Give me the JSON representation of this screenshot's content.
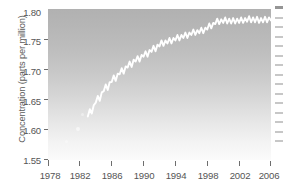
{
  "chart_data": {
    "type": "line",
    "title": "",
    "subtitle": "",
    "xlabel": "",
    "ylabel": "Concentration (parts per million)",
    "xlim": [
      1978,
      2006
    ],
    "ylim": [
      1.55,
      1.8
    ],
    "grid": false,
    "legend": null,
    "x_tick_labels": [
      "1978",
      "1982",
      "1986",
      "1990",
      "1994",
      "1998",
      "2002",
      "2006"
    ],
    "x_ticks": [
      1978,
      1982,
      1986,
      1990,
      1994,
      1998,
      2002,
      2006
    ],
    "y_tick_labels": [
      "1.55",
      "1.60",
      "1.65",
      "1.70",
      "1.75",
      "1.80"
    ],
    "y_ticks": [
      1.55,
      1.6,
      1.65,
      1.7,
      1.75,
      1.8
    ],
    "series": [
      {
        "name": "Concentration",
        "color": "#ffffff",
        "note": "White trace on grey gradient panel; annual seasonal sawtooth superimposed on rising trend that flattens after 1999",
        "x": [
          1983.0,
          1983.25,
          1983.5,
          1983.75,
          1984.0,
          1984.25,
          1984.5,
          1984.75,
          1985.0,
          1985.25,
          1985.5,
          1985.75,
          1986.0,
          1986.25,
          1986.5,
          1986.75,
          1987.0,
          1987.25,
          1987.5,
          1987.75,
          1988.0,
          1988.25,
          1988.5,
          1988.75,
          1989.0,
          1989.25,
          1989.5,
          1989.75,
          1990.0,
          1990.25,
          1990.5,
          1990.75,
          1991.0,
          1991.25,
          1991.5,
          1991.75,
          1992.0,
          1992.25,
          1992.5,
          1992.75,
          1993.0,
          1993.25,
          1993.5,
          1993.75,
          1994.0,
          1994.25,
          1994.5,
          1994.75,
          1995.0,
          1995.25,
          1995.5,
          1995.75,
          1996.0,
          1996.25,
          1996.5,
          1996.75,
          1997.0,
          1997.25,
          1997.5,
          1997.75,
          1998.0,
          1998.25,
          1998.5,
          1998.75,
          1999.0,
          1999.25,
          1999.5,
          1999.75,
          2000.0,
          2000.25,
          2000.5,
          2000.75,
          2001.0,
          2001.25,
          2001.5,
          2001.75,
          2002.0,
          2002.25,
          2002.5,
          2002.75,
          2003.0,
          2003.25,
          2003.5,
          2003.75,
          2004.0,
          2004.25,
          2004.5,
          2004.75,
          2005.0,
          2005.25,
          2005.5,
          2005.75,
          2006.0
        ],
        "y": [
          1.622,
          1.634,
          1.627,
          1.641,
          1.645,
          1.656,
          1.648,
          1.662,
          1.664,
          1.675,
          1.666,
          1.679,
          1.679,
          1.69,
          1.681,
          1.693,
          1.692,
          1.702,
          1.693,
          1.705,
          1.703,
          1.713,
          1.704,
          1.716,
          1.713,
          1.722,
          1.713,
          1.724,
          1.721,
          1.73,
          1.721,
          1.732,
          1.729,
          1.739,
          1.73,
          1.741,
          1.738,
          1.748,
          1.739,
          1.748,
          1.743,
          1.752,
          1.743,
          1.752,
          1.748,
          1.757,
          1.748,
          1.757,
          1.752,
          1.761,
          1.752,
          1.761,
          1.757,
          1.766,
          1.757,
          1.765,
          1.76,
          1.769,
          1.76,
          1.769,
          1.766,
          1.776,
          1.768,
          1.777,
          1.775,
          1.784,
          1.775,
          1.783,
          1.777,
          1.786,
          1.776,
          1.784,
          1.776,
          1.785,
          1.776,
          1.784,
          1.777,
          1.786,
          1.777,
          1.785,
          1.779,
          1.788,
          1.778,
          1.786,
          1.778,
          1.787,
          1.777,
          1.785,
          1.778,
          1.787,
          1.778,
          1.786,
          1.781
        ]
      }
    ]
  },
  "axes": {
    "ylabel": "Concentration (parts per million)",
    "y_ticks": [
      {
        "label": "1.80",
        "value": 1.8
      },
      {
        "label": "1.75",
        "value": 1.75
      },
      {
        "label": "1.70",
        "value": 1.7
      },
      {
        "label": "1.65",
        "value": 1.65
      },
      {
        "label": "1.60",
        "value": 1.6
      },
      {
        "label": "1.55",
        "value": 1.55
      }
    ],
    "x_ticks": [
      {
        "label": "1978",
        "value": 1978
      },
      {
        "label": "1982",
        "value": 1982
      },
      {
        "label": "1986",
        "value": 1986
      },
      {
        "label": "1990",
        "value": 1990
      },
      {
        "label": "1994",
        "value": 1994
      },
      {
        "label": "1998",
        "value": 1998
      },
      {
        "label": "2002",
        "value": 2002
      },
      {
        "label": "2006",
        "value": 2006
      }
    ]
  },
  "colors": {
    "line": "#ffffff",
    "panel_top": "#b1b1b1",
    "panel_bottom": "#fbfbfb",
    "tick": "#6e6e6e",
    "text": "#555555"
  }
}
